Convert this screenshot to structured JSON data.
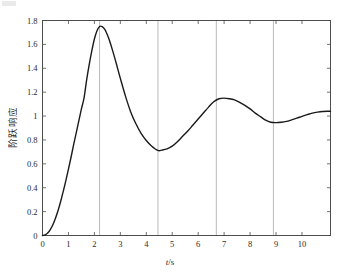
{
  "figure": {
    "width": 341,
    "height": 276,
    "background": "#ffffff",
    "axes_color": "#4d4d4d",
    "grid_color": "#b3b3b3",
    "curve_color": "#1a1a1a"
  },
  "chart_data": {
    "type": "line",
    "title": "",
    "xlabel": "t/s",
    "xlabel_parts": {
      "variable": "t",
      "separator": "/",
      "unit": "s"
    },
    "ylabel": "阶跃响应",
    "xlim": [
      0,
      11.1
    ],
    "ylim": [
      0,
      1.8
    ],
    "xticks": [
      0,
      1,
      2,
      3,
      4,
      5,
      6,
      7,
      8,
      9,
      10
    ],
    "xticklabels": [
      "0",
      "1",
      "2",
      "3",
      "4",
      "5",
      "6",
      "7",
      "8",
      "9",
      "10"
    ],
    "yticks": [
      0,
      0.2,
      0.4,
      0.6,
      0.8,
      1,
      1.2,
      1.4,
      1.6,
      1.8
    ],
    "yticklabels": [
      "0",
      "0.2",
      "0.4",
      "0.6",
      "0.8",
      "1",
      "1.2",
      "1.4",
      "1.6",
      "1.8"
    ],
    "grid": {
      "vertical": true,
      "horizontal": false,
      "vertical_at": [
        2.2,
        4.45,
        6.7,
        8.9
      ]
    },
    "legend": {
      "visible": false,
      "position": "none"
    },
    "series": [
      {
        "name": "阶跃响应",
        "color": "#1a1a1a",
        "linewidth": 1.4,
        "x": [
          0,
          0.1,
          0.2,
          0.3,
          0.4,
          0.5,
          0.6,
          0.7,
          0.8,
          0.9,
          1.0,
          1.1,
          1.2,
          1.3,
          1.4,
          1.5,
          1.6,
          1.7,
          1.8,
          1.9,
          2.0,
          2.1,
          2.2,
          2.3,
          2.4,
          2.5,
          2.6,
          2.7,
          2.8,
          2.9,
          3.0,
          3.2,
          3.4,
          3.6,
          3.8,
          4.0,
          4.2,
          4.45,
          4.6,
          4.8,
          5.0,
          5.2,
          5.4,
          5.6,
          5.8,
          6.0,
          6.2,
          6.4,
          6.6,
          6.8,
          7.0,
          7.2,
          7.4,
          7.6,
          7.8,
          8.0,
          8.2,
          8.4,
          8.6,
          8.8,
          9.0,
          9.2,
          9.4,
          9.6,
          9.8,
          10.0,
          10.2,
          10.4,
          10.6,
          10.8,
          11.0,
          11.1
        ],
        "y": [
          0.0,
          0.005,
          0.02,
          0.05,
          0.09,
          0.145,
          0.21,
          0.285,
          0.37,
          0.46,
          0.555,
          0.655,
          0.76,
          0.86,
          0.96,
          1.06,
          1.15,
          1.3,
          1.43,
          1.545,
          1.645,
          1.715,
          1.75,
          1.748,
          1.725,
          1.68,
          1.62,
          1.55,
          1.475,
          1.395,
          1.315,
          1.165,
          1.035,
          0.935,
          0.855,
          0.795,
          0.75,
          0.712,
          0.715,
          0.725,
          0.748,
          0.785,
          0.83,
          0.875,
          0.925,
          0.975,
          1.025,
          1.075,
          1.12,
          1.145,
          1.15,
          1.145,
          1.135,
          1.115,
          1.09,
          1.06,
          1.025,
          0.995,
          0.965,
          0.948,
          0.945,
          0.948,
          0.955,
          0.968,
          0.982,
          0.998,
          1.012,
          1.025,
          1.033,
          1.038,
          1.04,
          1.04
        ]
      }
    ],
    "annotations": {
      "first_peak": {
        "t": 2.2,
        "value": 1.75
      },
      "first_trough": {
        "t": 4.45,
        "value": 0.71
      },
      "second_peak": {
        "t": 6.7,
        "value": 1.15
      },
      "second_trough": {
        "t": 8.9,
        "value": 0.945
      },
      "steady_state": 1.04
    }
  }
}
